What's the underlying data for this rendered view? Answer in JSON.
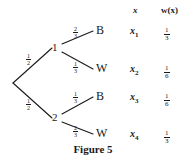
{
  "figure": {
    "caption": "Figure 5",
    "type": "probability-tree"
  },
  "columns": {
    "outcome_header": "x",
    "weight_header": "w(x)"
  },
  "tree": {
    "root": {
      "label": ""
    },
    "level1": [
      {
        "id": "node1",
        "label": "1",
        "prob_num": "1",
        "prob_den": "2"
      },
      {
        "id": "node2",
        "label": "2",
        "prob_num": "1",
        "prob_den": "2"
      }
    ],
    "level2": [
      {
        "parent": "node1",
        "label": "B",
        "prob_num": "2",
        "prob_den": "3"
      },
      {
        "parent": "node1",
        "label": "W",
        "prob_num": "1",
        "prob_den": "3"
      },
      {
        "parent": "node2",
        "label": "B",
        "prob_num": "1",
        "prob_den": "3"
      },
      {
        "parent": "node2",
        "label": "W",
        "prob_num": "2",
        "prob_den": "3"
      }
    ]
  },
  "rows": [
    {
      "outcome": "x",
      "index": "1",
      "weight_num": "1",
      "weight_den": "3"
    },
    {
      "outcome": "x",
      "index": "2",
      "weight_num": "1",
      "weight_den": "6"
    },
    {
      "outcome": "x",
      "index": "3",
      "weight_num": "1",
      "weight_den": "6"
    },
    {
      "outcome": "x",
      "index": "4",
      "weight_num": "1",
      "weight_den": "3"
    }
  ],
  "colors": {
    "ink": "#1a1a1a",
    "background": "#ffffff"
  }
}
